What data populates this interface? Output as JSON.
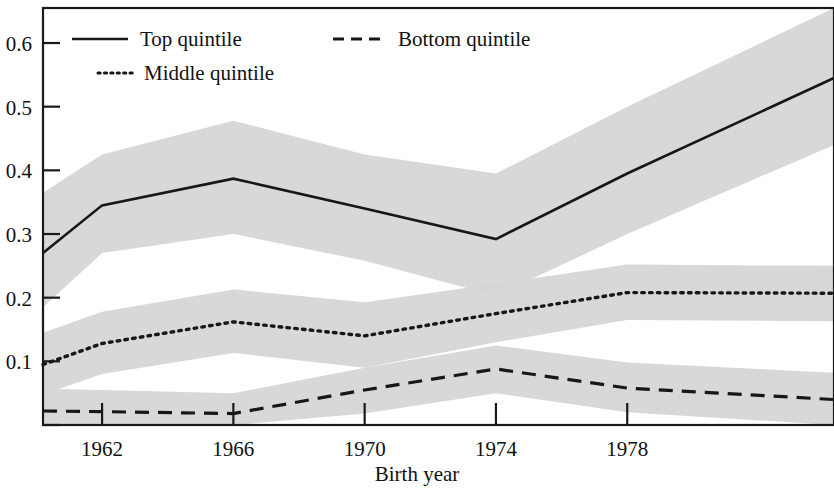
{
  "chart_data": {
    "type": "line",
    "title": "",
    "xlabel": "Birth year",
    "ylabel": "",
    "xlim": [
      1960.2,
      1984.3
    ],
    "ylim": [
      0.0,
      0.655
    ],
    "grid": false,
    "legend_position": "top-left inside plot",
    "xticks": [
      1962,
      1966,
      1970,
      1974,
      1978
    ],
    "xtick_labels": [
      "1962",
      "1966",
      "1970",
      "1974",
      "1978"
    ],
    "yticks": [
      0.1,
      0.2,
      0.3,
      0.4,
      0.5,
      0.6
    ],
    "ytick_labels": [
      "0.1",
      "0.2",
      "0.3",
      "0.4",
      "0.5",
      "0.6"
    ],
    "band_color": "#d6d6d6",
    "line_color": "#171717",
    "x": [
      1960.2,
      1962,
      1966,
      1970,
      1974,
      1978,
      1984.3
    ],
    "series": [
      {
        "name": "Top quintile",
        "style": "solid",
        "values": [
          0.27,
          0.345,
          0.387,
          0.34,
          0.292,
          0.395,
          0.545
        ],
        "band_upper": [
          0.365,
          0.425,
          0.478,
          0.425,
          0.395,
          0.5,
          0.655
        ],
        "band_lower": [
          0.185,
          0.27,
          0.3,
          0.258,
          0.203,
          0.3,
          0.44
        ]
      },
      {
        "name": "Middle quintile",
        "style": "dotted",
        "values": [
          0.095,
          0.128,
          0.162,
          0.14,
          0.175,
          0.208,
          0.207
        ],
        "band_upper": [
          0.145,
          0.178,
          0.213,
          0.193,
          0.222,
          0.252,
          0.25
        ],
        "band_lower": [
          0.048,
          0.08,
          0.113,
          0.09,
          0.13,
          0.165,
          0.163
        ]
      },
      {
        "name": "Bottom quintile",
        "style": "dashed",
        "values": [
          0.022,
          0.021,
          0.018,
          0.055,
          0.088,
          0.058,
          0.04
        ],
        "band_upper": [
          0.057,
          0.055,
          0.05,
          0.09,
          0.125,
          0.098,
          0.082
        ],
        "band_lower": [
          0.0,
          0.0,
          0.0,
          0.018,
          0.05,
          0.02,
          0.0
        ]
      }
    ]
  },
  "legend": {
    "items": [
      {
        "label": "Top quintile",
        "style": "solid"
      },
      {
        "label": "Bottom quintile",
        "style": "dashed"
      },
      {
        "label": "Middle quintile",
        "style": "dotted"
      }
    ]
  },
  "axes": {
    "x_title": "Birth year"
  }
}
